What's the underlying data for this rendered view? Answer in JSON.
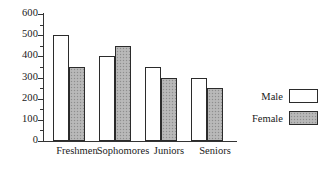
{
  "chart_data": {
    "type": "bar",
    "title": "",
    "subtitle": "",
    "xlabel": "",
    "ylabel": "",
    "categories": [
      "Freshmen",
      "Sophomores",
      "Juniors",
      "Seniors"
    ],
    "series": [
      {
        "name": "Male",
        "values": [
          500,
          400,
          350,
          300
        ]
      },
      {
        "name": "Female",
        "values": [
          350,
          450,
          300,
          250
        ]
      }
    ],
    "ylim": [
      0,
      600
    ],
    "yticks": [
      0,
      100,
      200,
      300,
      400,
      500,
      600
    ],
    "ytick_labels": [
      "0",
      "100",
      "200",
      "300",
      "400",
      "500",
      "600"
    ],
    "yminor_ticks": [
      50,
      150,
      250,
      350,
      450,
      550
    ],
    "grid": false,
    "legend_position": "right",
    "legend_entries": [
      {
        "label": "Male",
        "swatch": "white"
      },
      {
        "label": "Female",
        "swatch": "gray-stipple"
      }
    ],
    "colors": {
      "male": "#ffffff",
      "female": "#b4b4b4",
      "outline": "#2b2b2b",
      "axis": "#333333",
      "background": "#ffffff"
    }
  }
}
